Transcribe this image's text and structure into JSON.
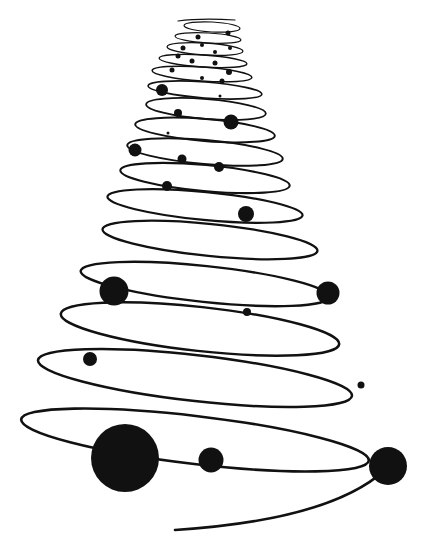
{
  "illustration": {
    "subject": "spiral christmas tree with ornaments",
    "width": 432,
    "height": 555,
    "background": "#ffffff",
    "ink": "#111111",
    "coils": [
      {
        "cx": 212,
        "cy": 27,
        "rx": 28,
        "ry": 5,
        "sw": 1.2
      },
      {
        "cx": 208,
        "cy": 38,
        "rx": 33,
        "ry": 5,
        "sw": 1.2
      },
      {
        "cx": 205,
        "cy": 49,
        "rx": 38,
        "ry": 6,
        "sw": 1.3
      },
      {
        "cx": 203,
        "cy": 61,
        "rx": 44,
        "ry": 6,
        "sw": 1.4
      },
      {
        "cx": 202,
        "cy": 74,
        "rx": 50,
        "ry": 7,
        "sw": 1.5
      },
      {
        "cx": 205,
        "cy": 90,
        "rx": 57,
        "ry": 8,
        "sw": 1.7
      },
      {
        "cx": 206,
        "cy": 109,
        "rx": 60,
        "ry": 10,
        "sw": 1.8
      },
      {
        "cx": 205,
        "cy": 130,
        "rx": 70,
        "ry": 11,
        "sw": 2.0
      },
      {
        "cx": 205,
        "cy": 152,
        "rx": 78,
        "ry": 12,
        "sw": 2.0
      },
      {
        "cx": 205,
        "cy": 178,
        "rx": 85,
        "ry": 13,
        "sw": 2.1
      },
      {
        "cx": 205,
        "cy": 206,
        "rx": 98,
        "ry": 14,
        "sw": 2.2
      },
      {
        "cx": 210,
        "cy": 240,
        "rx": 108,
        "ry": 16,
        "sw": 2.3
      },
      {
        "cx": 205,
        "cy": 284,
        "rx": 125,
        "ry": 18,
        "sw": 2.4
      },
      {
        "cx": 200,
        "cy": 329,
        "rx": 140,
        "ry": 22,
        "sw": 2.5
      },
      {
        "cx": 195,
        "cy": 378,
        "rx": 158,
        "ry": 23,
        "sw": 2.5
      },
      {
        "cx": 195,
        "cy": 440,
        "rx": 175,
        "ry": 24,
        "sw": 2.6
      }
    ],
    "tail": {
      "d": "M 385 470 Q 330 520 175 530",
      "sw": 2.6
    },
    "top_hook": {
      "d": "M 178 21 Q 200 18 235 20",
      "sw": 1.2
    },
    "ornaments": [
      {
        "x": 198,
        "y": 37,
        "r": 2.5
      },
      {
        "x": 228,
        "y": 33,
        "r": 2.5
      },
      {
        "x": 202,
        "y": 45,
        "r": 2
      },
      {
        "x": 183,
        "y": 48,
        "r": 2.5
      },
      {
        "x": 215,
        "y": 52,
        "r": 2
      },
      {
        "x": 178,
        "y": 56,
        "r": 2.5
      },
      {
        "x": 230,
        "y": 48,
        "r": 2
      },
      {
        "x": 192,
        "y": 61,
        "r": 2.5
      },
      {
        "x": 215,
        "y": 63,
        "r": 2.5
      },
      {
        "x": 172,
        "y": 70,
        "r": 2.5
      },
      {
        "x": 229,
        "y": 72,
        "r": 3
      },
      {
        "x": 202,
        "y": 78,
        "r": 2
      },
      {
        "x": 222,
        "y": 81,
        "r": 2.5
      },
      {
        "x": 162,
        "y": 90,
        "r": 6
      },
      {
        "x": 220,
        "y": 96,
        "r": 1.5
      },
      {
        "x": 178,
        "y": 113,
        "r": 4
      },
      {
        "x": 231,
        "y": 122,
        "r": 7.5
      },
      {
        "x": 168,
        "y": 133,
        "r": 1.5
      },
      {
        "x": 135,
        "y": 150,
        "r": 6.5
      },
      {
        "x": 182,
        "y": 159,
        "r": 4.5
      },
      {
        "x": 219,
        "y": 167,
        "r": 5
      },
      {
        "x": 167,
        "y": 186,
        "r": 5
      },
      {
        "x": 246,
        "y": 214,
        "r": 8
      },
      {
        "x": 114,
        "y": 291,
        "r": 14.5
      },
      {
        "x": 328,
        "y": 293,
        "r": 11.5
      },
      {
        "x": 247,
        "y": 312,
        "r": 4
      },
      {
        "x": 90,
        "y": 359,
        "r": 7
      },
      {
        "x": 361,
        "y": 385,
        "r": 3.5
      },
      {
        "x": 125,
        "y": 458,
        "r": 34
      },
      {
        "x": 211,
        "y": 460,
        "r": 12.5
      },
      {
        "x": 388,
        "y": 466,
        "r": 19
      }
    ]
  }
}
